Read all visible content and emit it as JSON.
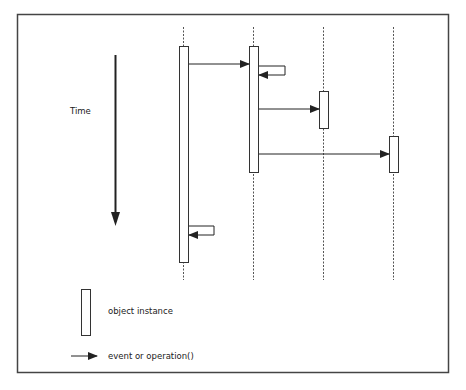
{
  "diagram": {
    "type": "sequence-diagram",
    "time_label": "Time",
    "lifelines": [
      {
        "id": "obj1",
        "activation": {
          "start": 0.0,
          "end": 1.0
        }
      },
      {
        "id": "obj2",
        "activation": {
          "start": 0.0,
          "end": 0.58
        }
      },
      {
        "id": "obj3",
        "activation": {
          "start": 0.2,
          "end": 0.37
        }
      },
      {
        "id": "obj4",
        "activation": {
          "start": 0.42,
          "end": 0.58
        }
      }
    ],
    "messages": [
      {
        "from": "obj1",
        "to": "obj2",
        "kind": "call"
      },
      {
        "from": "obj2",
        "to": "obj2",
        "kind": "self-call"
      },
      {
        "from": "obj2",
        "to": "obj3",
        "kind": "call"
      },
      {
        "from": "obj2",
        "to": "obj4",
        "kind": "call"
      },
      {
        "from": "obj1",
        "to": "obj1",
        "kind": "self-call"
      }
    ],
    "legend": {
      "object_instance": "object instance",
      "event": "event or operation()"
    },
    "colors": {
      "line": "#333333",
      "frame": "#444444",
      "dash": "#555555",
      "background": "#ffffff"
    }
  }
}
